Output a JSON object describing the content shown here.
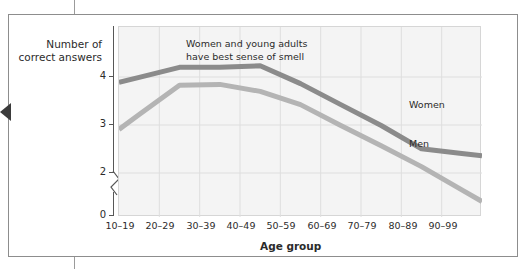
{
  "figure": {
    "annotation": "Women and young adults\nhave best sense of smell",
    "y_axis_title": "Number of\ncorrect answers",
    "x_axis_title": "Age group"
  },
  "chart_data": {
    "type": "line",
    "title": "",
    "subtitle": "",
    "xlabel": "Age group",
    "ylabel": "Number of correct answers",
    "categories": [
      "10–19",
      "20–29",
      "30–39",
      "40–49",
      "50–59",
      "60–69",
      "70–79",
      "80–89",
      "90–99"
    ],
    "ylim": [
      2,
      4.45
    ],
    "ytick_labels": [
      "0",
      "2",
      "3",
      "4"
    ],
    "ytick_values": [
      0,
      2,
      3,
      4
    ],
    "axis_break": true,
    "grid": true,
    "legend_position": "inline-right",
    "series": [
      {
        "name": "Women",
        "color": "#8b8b8b",
        "values": [
          3.8,
          3.93,
          3.93,
          3.95,
          3.72,
          3.45,
          3.18,
          2.88,
          2.82
        ]
      },
      {
        "name": "Men",
        "color": "#b4b4b4",
        "values": [
          3.32,
          3.7,
          3.71,
          3.62,
          3.45,
          3.18,
          2.92,
          2.65,
          2.35
        ]
      }
    ],
    "annotations": [
      {
        "text": "Women and young adults have best sense of smell",
        "x_category": "30–39",
        "y": 4.3
      }
    ]
  },
  "ticks": {
    "y": [
      "4",
      "3",
      "2",
      "0"
    ],
    "x": [
      "10–19",
      "20–29",
      "30–39",
      "40–49",
      "50–59",
      "60–69",
      "70–79",
      "80–89",
      "90–99"
    ]
  },
  "series_labels": {
    "women": "Women",
    "men": "Men"
  },
  "colors": {
    "women_line": "#8b8b8b",
    "men_line": "#b4b4b4",
    "plot_background": "#f4f4f4",
    "gridline": "#dedede",
    "axis": "#575757",
    "frame": "#8d8d8d",
    "text": "#2b2b2b"
  }
}
